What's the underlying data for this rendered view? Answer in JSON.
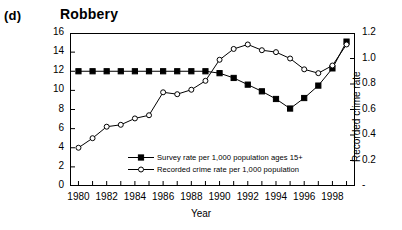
{
  "panel_label": "(d)",
  "title": "Robbery",
  "axes": {
    "left_title": "Survey rate",
    "right_title": "Recorded crime rate",
    "x_title": "Year",
    "left_ticks": [
      "0",
      "2",
      "4",
      "6",
      "8",
      "10",
      "12",
      "14",
      "16"
    ],
    "right_ticks": [
      "-",
      "0.2",
      "0.4",
      "0.6",
      "0.8",
      "1.0",
      "1.2"
    ],
    "x_ticks": [
      "1980",
      "1982",
      "1984",
      "1986",
      "1988",
      "1990",
      "1992",
      "1994",
      "1996",
      "1998"
    ]
  },
  "legend": {
    "items": [
      {
        "key": "filled-square-line",
        "label": "Survey rate per 1,000 population ages 15+"
      },
      {
        "key": "open-circle-line",
        "label": "Recorded crime rate per 1,000 population"
      }
    ]
  },
  "chart_data": {
    "type": "line",
    "title": "Robbery",
    "panel": "(d)",
    "xlabel": "Year",
    "ylabel": "Survey rate",
    "y2label": "Recorded crime rate",
    "xlim": [
      1979.4,
      1999.6
    ],
    "ylim": [
      0,
      16
    ],
    "y2lim": [
      0,
      1.2
    ],
    "ytick_step": 2,
    "y2tick_step": 0.2,
    "grid": false,
    "legend_position": "inside-lower-center",
    "x": [
      1980,
      1981,
      1982,
      1983,
      1984,
      1985,
      1986,
      1987,
      1988,
      1989,
      1990,
      1991,
      1992,
      1993,
      1994,
      1995,
      1996,
      1997,
      1998,
      1999
    ],
    "series": [
      {
        "name": "Survey rate per 1,000 population ages 15+",
        "axis": "left",
        "marker": "filled-square",
        "values": [
          12.0,
          12.0,
          12.0,
          12.0,
          12.0,
          12.0,
          12.0,
          12.0,
          12.0,
          12.0,
          11.8,
          11.3,
          10.6,
          9.9,
          9.1,
          8.1,
          9.2,
          10.5,
          12.3,
          15.1
        ]
      },
      {
        "name": "Recorded crime rate per 1,000 population",
        "axis": "right",
        "marker": "open-circle",
        "values": [
          0.3,
          0.375,
          0.465,
          0.48,
          0.53,
          0.555,
          0.735,
          0.72,
          0.755,
          0.825,
          0.99,
          1.075,
          1.11,
          1.065,
          1.05,
          1.0,
          0.915,
          0.885,
          0.945,
          1.11
        ]
      }
    ]
  }
}
